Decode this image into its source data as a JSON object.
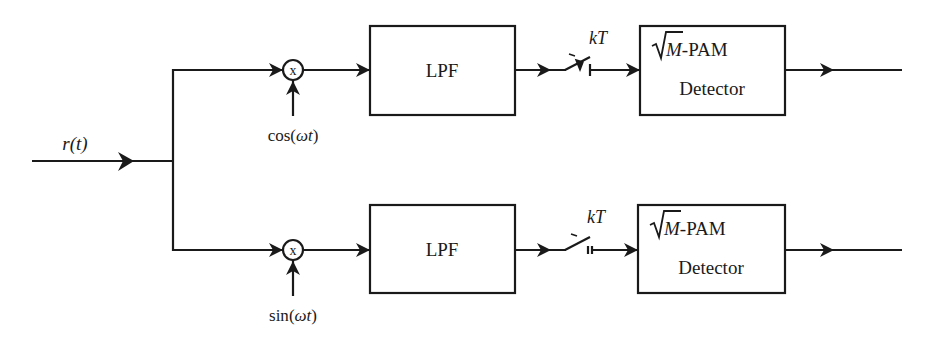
{
  "diagram": {
    "title": "",
    "input": {
      "label": "r(t)"
    },
    "branches": [
      {
        "id": "in-phase",
        "mixer_label": "x",
        "carrier_label_fn": "cos",
        "carrier_label_arg": "ωt",
        "filter_label": "LPF",
        "sampler_label": "kT",
        "detector_sqrt": "M",
        "detector_suffix": "-PAM",
        "detector_label2": "Detector"
      },
      {
        "id": "quadrature",
        "mixer_label": "x",
        "carrier_label_fn": "sin",
        "carrier_label_arg": "ωt",
        "filter_label": "LPF",
        "sampler_label": "kT",
        "detector_sqrt": "M",
        "detector_suffix": "-PAM",
        "detector_label2": "Detector"
      }
    ],
    "colors": {
      "line": "#1a1a1a",
      "background": "#ffffff"
    }
  }
}
